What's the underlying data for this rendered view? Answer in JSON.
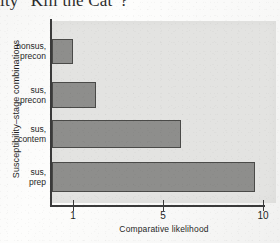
{
  "page": {
    "cropped_caption": "ity “Kill the Cat”?"
  },
  "chart_data": {
    "type": "bar",
    "orientation": "horizontal",
    "title": "",
    "xlabel": "Comparative likelihood",
    "ylabel": "Susceptibility–stage combinations",
    "categories": [
      "nonsus, precon",
      "sus, precon",
      "sus, contem",
      "sus, prep"
    ],
    "category_lines": [
      [
        "nonsus,",
        "precon"
      ],
      [
        "sus,",
        "precon"
      ],
      [
        "sus,",
        "contem"
      ],
      [
        "sus,",
        "prep"
      ]
    ],
    "values": [
      1.0,
      2.1,
      6.1,
      9.6
    ],
    "xticks": [
      1,
      5,
      10
    ],
    "xticklabels": [
      "1",
      "5",
      "10"
    ],
    "xlim": [
      0.55,
      10.4
    ],
    "grid": false,
    "legend": null,
    "bar_fill_color": "#8e8e8c",
    "bar_edge_color": "#4a4a48",
    "plot_background_color": "#e3e3e1",
    "axis_color": "#3a3a3a"
  }
}
